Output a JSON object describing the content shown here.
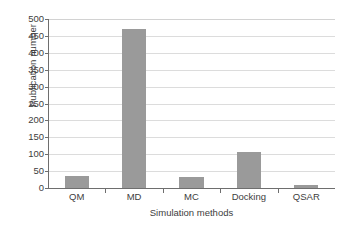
{
  "chart_data": {
    "type": "bar",
    "title": "",
    "xlabel": "Simulation methods",
    "ylabel": "Publication number",
    "categories": [
      "QM",
      "MD",
      "MC",
      "Docking",
      "QSAR"
    ],
    "values": [
      36,
      470,
      32,
      106,
      9
    ],
    "ylim": [
      0,
      500
    ],
    "ytick_step": 50,
    "yticks": [
      0,
      50,
      100,
      150,
      200,
      250,
      300,
      350,
      400,
      450,
      500
    ],
    "ytick_labels": [
      "0",
      "50",
      "100",
      "150",
      "200",
      "250",
      "300",
      "350",
      "400",
      "450",
      "500"
    ],
    "grid": "horizontal",
    "legend": "none",
    "series": [
      {
        "name": "Publication number",
        "values": [
          36,
          470,
          32,
          106,
          9
        ]
      }
    ],
    "colors": {
      "bar_fill": "#9a9a9a",
      "gridline": "#dcdcdc",
      "axis": "#6e6e6e",
      "text": "#3d3d3d",
      "background": "#ffffff"
    }
  }
}
